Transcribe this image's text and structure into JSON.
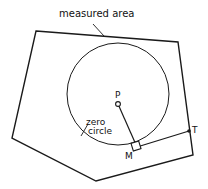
{
  "labels": {
    "measured_area": "measured    area",
    "zero_circle_1": "zero",
    "zero_circle_2": "circle",
    "pole": "P",
    "measuring_wheel": "M",
    "tracer": "T"
  },
  "colors": {
    "stroke": "#1a1a1a",
    "background": "#ffffff"
  }
}
